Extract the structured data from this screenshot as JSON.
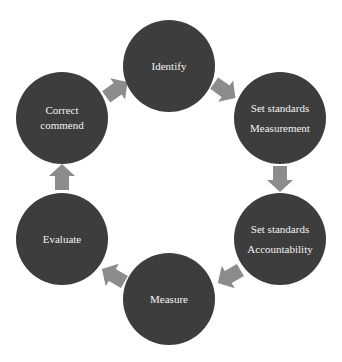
{
  "diagram": {
    "type": "cycle",
    "colors": {
      "node_fill": "#3d3d3d",
      "node_text": "#f2f2f2",
      "arrow_fill": "#8c8c8c",
      "background": "#ffffff"
    },
    "nodes": [
      {
        "id": "identify",
        "lines": [
          "Identify"
        ]
      },
      {
        "id": "set-standards-measurement",
        "lines": [
          "Set standards",
          "Measurement"
        ]
      },
      {
        "id": "set-standards-accountability",
        "lines": [
          "Set standards",
          "Accountability"
        ]
      },
      {
        "id": "measure",
        "lines": [
          "Measure"
        ]
      },
      {
        "id": "evaluate",
        "lines": [
          "Evaluate"
        ]
      },
      {
        "id": "correct-commend",
        "lines": [
          "Correct",
          "commend"
        ]
      }
    ],
    "edges": [
      {
        "from": "identify",
        "to": "set-standards-measurement"
      },
      {
        "from": "set-standards-measurement",
        "to": "set-standards-accountability"
      },
      {
        "from": "set-standards-accountability",
        "to": "measure"
      },
      {
        "from": "measure",
        "to": "evaluate"
      },
      {
        "from": "evaluate",
        "to": "correct-commend"
      },
      {
        "from": "correct-commend",
        "to": "identify"
      }
    ]
  }
}
